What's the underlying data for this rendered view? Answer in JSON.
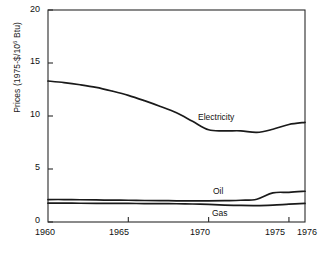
{
  "chart_data": {
    "type": "line",
    "title": "",
    "xlabel": "",
    "ylabel": "Prices (1975-$/10",
    "ylabel_exp": "6",
    "ylabel_tail": " Btu)",
    "xlim": [
      1960,
      1976
    ],
    "ylim": [
      0,
      20
    ],
    "grid": false,
    "legend_position": "inline-annotations",
    "xticks": [
      1960,
      1965,
      1970,
      1975,
      1976
    ],
    "xticklabels": [
      "1960",
      "1965",
      "1970",
      "1975",
      "1976"
    ],
    "yticks": [
      0,
      5,
      10,
      15,
      20
    ],
    "yticklabels": [
      "0",
      "5",
      "10",
      "15",
      "20"
    ],
    "x": [
      1960,
      1961,
      1962,
      1963,
      1964,
      1965,
      1966,
      1967,
      1968,
      1969,
      1970,
      1971,
      1972,
      1973,
      1974,
      1975,
      1976
    ],
    "series": [
      {
        "name": "Electricity",
        "label": "Electricity",
        "color": "#1a1a1a",
        "values": [
          13.3,
          13.15,
          12.95,
          12.7,
          12.35,
          11.95,
          11.45,
          10.9,
          10.3,
          9.5,
          8.7,
          8.6,
          8.6,
          8.45,
          8.75,
          9.2,
          9.4
        ]
      },
      {
        "name": "Oil",
        "label": "Oil",
        "color": "#1a1a1a",
        "values": [
          2.12,
          2.12,
          2.1,
          2.08,
          2.06,
          2.05,
          2.03,
          2.02,
          2.0,
          2.0,
          2.0,
          2.02,
          2.05,
          2.15,
          2.75,
          2.8,
          2.9
        ]
      },
      {
        "name": "Gas",
        "label": "Gas",
        "color": "#1a1a1a",
        "values": [
          1.78,
          1.78,
          1.77,
          1.76,
          1.76,
          1.75,
          1.74,
          1.73,
          1.72,
          1.7,
          1.66,
          1.6,
          1.56,
          1.55,
          1.6,
          1.68,
          1.75
        ]
      }
    ],
    "annotations": [
      {
        "text": "Electricity",
        "x": 1971.4,
        "y": 9.9
      },
      {
        "text": "Oil",
        "x": 1971.6,
        "y": 2.85
      },
      {
        "text": "Gas",
        "x": 1971.6,
        "y": 0.75
      }
    ],
    "axis_color": "#2b2b2b",
    "line_color": "#1a1a1a",
    "background": "#ffffff"
  }
}
